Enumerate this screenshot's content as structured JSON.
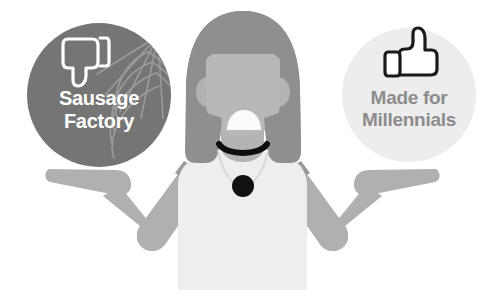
{
  "illustration": {
    "title": "Shrugging person weighing two options",
    "background_color": "#ffffff",
    "badges": [
      {
        "id": "negative",
        "icon_name": "thumbs-down-icon",
        "decoration_name": "spider-web-decoration",
        "circle_color": "#757575",
        "text_color": "#ffffff",
        "icon_color": "#ffffff",
        "line1": "Sausage",
        "line2": "Factory",
        "center_x": 99,
        "center_y": 95,
        "radius": 72
      },
      {
        "id": "positive",
        "icon_name": "thumbs-up-icon",
        "circle_color": "#ededed",
        "text_color": "#8c8c8c",
        "icon_color": "#1a1a1a",
        "line1": "Made for",
        "line2": "Millennials",
        "center_x": 409,
        "center_y": 95,
        "radius": 67
      }
    ],
    "figure": {
      "name": "shrugging-woman",
      "hair_color": "#8f8f8f",
      "skin_color": "#b3b3b3",
      "shirt_color": "#eeeeee",
      "arm_color": "#b0b0b0",
      "sleeve_color": "#9a9a9a",
      "mouth_color": "#fbfbfb",
      "choker_color": "#0d0d0d",
      "necklace_chain_color": "#d8d8d8",
      "pendant_color": "#111111",
      "pose": "shrug",
      "mouth_shape": "open-half-dome"
    }
  }
}
